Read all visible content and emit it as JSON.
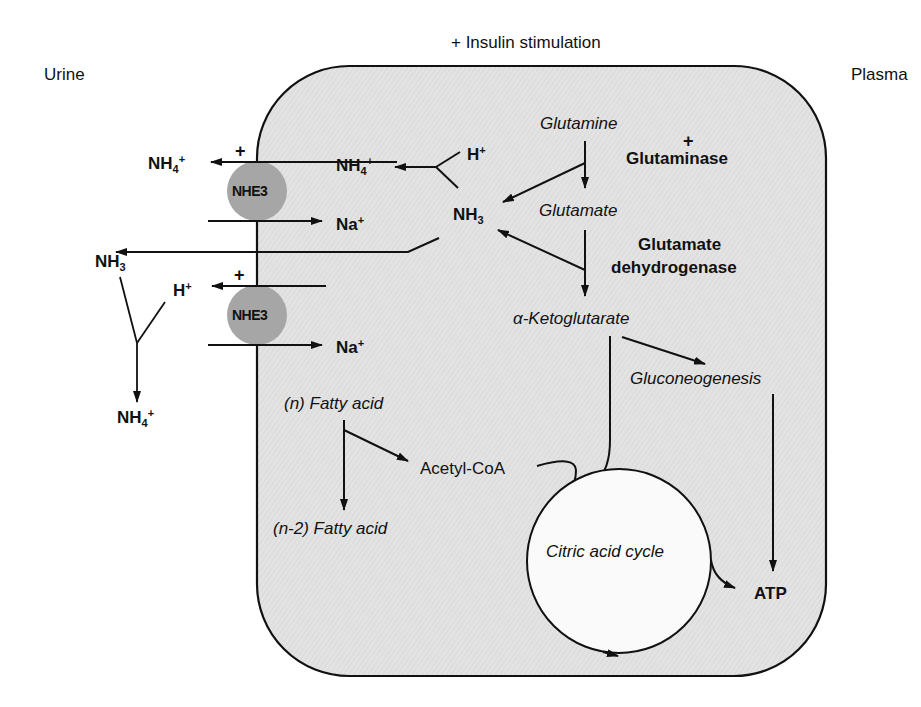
{
  "header": {
    "stimulation": "+ Insulin stimulation",
    "left_compartment": "Urine",
    "right_compartment": "Plasma"
  },
  "colors": {
    "cell_fill": "#e2e2e2",
    "transporter_fill": "#a6a6a6",
    "cycle_fill": "#fafafa",
    "stroke": "#111111"
  },
  "transporters": [
    {
      "label": "NHE3"
    },
    {
      "label": "NHE3"
    }
  ],
  "urine_side": {
    "nh4_top": {
      "base": "NH",
      "sub": "4",
      "sup": "+"
    },
    "nh3": {
      "base": "NH",
      "sub": "3"
    },
    "h_plus": {
      "base": "H",
      "sup": "+"
    },
    "nh4_bottom": {
      "base": "NH",
      "sub": "4",
      "sup": "+"
    },
    "plus_top": "+",
    "plus_mid": "+"
  },
  "cell": {
    "nh4_inner": {
      "base": "NH",
      "sub": "4",
      "sup": "+"
    },
    "h_plus_inner": {
      "base": "H",
      "sup": "+"
    },
    "na_top": {
      "base": "Na",
      "sup": "+"
    },
    "na_bottom": {
      "base": "Na",
      "sup": "+"
    },
    "nh3_inner": {
      "base": "NH",
      "sub": "3"
    },
    "glutamine": "Glutamine",
    "glutaminase_plus": "+",
    "glutaminase": "Glutaminase",
    "glutamate": "Glutamate",
    "gdh_line1": "Glutamate",
    "gdh_line2": "dehydrogenase",
    "alpha_kg": "α-Ketoglutarate",
    "gluconeogenesis": "Gluconeogenesis",
    "fatty_acid_n": "(n) Fatty acid",
    "fatty_acid_n2": "(n-2) Fatty acid",
    "acetyl_coa": "Acetyl-CoA",
    "citric_acid_cycle": "Citric acid cycle",
    "atp": "ATP"
  }
}
